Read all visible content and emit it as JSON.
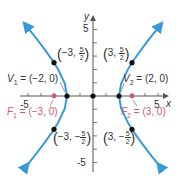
{
  "figure": {
    "type": "hyperbola-graph",
    "equation": "x^2/4 - y^2/5 = 1",
    "axes": {
      "x_label": "x",
      "y_label": "y",
      "x_ticks": {
        "min": -5,
        "max": 5,
        "labels": [
          "-5",
          "5"
        ]
      },
      "y_ticks": {
        "min": -5,
        "max": 5,
        "labels": [
          "5",
          "-5"
        ]
      }
    },
    "colors": {
      "curve": "#3a9ad9",
      "axes": "#555555",
      "points": "#111111",
      "focus": "#d3566f"
    },
    "points": {
      "v1": {
        "name": "V",
        "sub": "1",
        "rest": " = (−2, 0)"
      },
      "v2": {
        "name": "V",
        "sub": "2",
        "rest": " = (2, 0)"
      },
      "f1": {
        "name": "F",
        "sub": "1",
        "rest": " = (−3, 0)"
      },
      "f2": {
        "name": "F",
        "sub": "2",
        "rest": " = (3, 0)"
      },
      "p1": {
        "x": "−3,",
        "num": "5",
        "den": "2"
      },
      "p2": {
        "x": "3,",
        "num": "5",
        "den": "2"
      },
      "p3": {
        "x": "−3, −",
        "num": "5",
        "den": "2"
      },
      "p4": {
        "x": "3, −",
        "num": "5",
        "den": "2"
      }
    }
  }
}
